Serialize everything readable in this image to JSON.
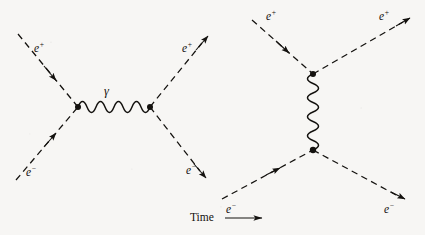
{
  "figure": {
    "background_color": "#f7f6f4",
    "ink_color": "#14120f",
    "axis_label": {
      "text": "Time",
      "arrow": "right-arrow",
      "x": 190,
      "y": 215
    },
    "diagrams": [
      {
        "id": "annihilation",
        "channel": "s-channel",
        "vertices": [
          {
            "name": "left-vertex",
            "x": 78,
            "y": 107
          },
          {
            "name": "right-vertex",
            "x": 150,
            "y": 107
          }
        ],
        "photon": {
          "label": "γ",
          "label_x": 104,
          "label_y": 86,
          "orientation": "horizontal",
          "from": {
            "x": 78,
            "y": 107
          },
          "to": {
            "x": 150,
            "y": 107
          },
          "wavelengths": 4
        },
        "legs": [
          {
            "name": "incoming-positron",
            "label": "e",
            "charge": "+",
            "label_x": 34,
            "label_y": 42,
            "from": {
              "x": 18,
              "y": 34
            },
            "to": {
              "x": 78,
              "y": 107
            },
            "arrow_position": "mid",
            "arrow_direction": "toward-vertex",
            "line_style": "dashed"
          },
          {
            "name": "incoming-electron",
            "label": "e",
            "charge": "−",
            "label_x": 26,
            "label_y": 166,
            "from": {
              "x": 16,
              "y": 180
            },
            "to": {
              "x": 78,
              "y": 107
            },
            "arrow_position": "mid",
            "arrow_direction": "toward-vertex",
            "line_style": "dashed"
          },
          {
            "name": "outgoing-positron",
            "label": "e",
            "charge": "+",
            "label_x": 182,
            "label_y": 42,
            "from": {
              "x": 150,
              "y": 107
            },
            "to": {
              "x": 208,
              "y": 36
            },
            "arrow_position": "end",
            "arrow_direction": "away-from-vertex",
            "line_style": "dashed"
          },
          {
            "name": "outgoing-electron",
            "label": "e",
            "charge": "−",
            "label_x": 186,
            "label_y": 164,
            "from": {
              "x": 150,
              "y": 107
            },
            "to": {
              "x": 206,
              "y": 178
            },
            "arrow_position": "end",
            "arrow_direction": "away-from-vertex",
            "line_style": "dashed"
          }
        ]
      },
      {
        "id": "scattering",
        "channel": "t-channel",
        "vertices": [
          {
            "name": "top-vertex",
            "x": 313,
            "y": 74
          },
          {
            "name": "bottom-vertex",
            "x": 313,
            "y": 150
          }
        ],
        "photon": {
          "label": "",
          "orientation": "vertical",
          "from": {
            "x": 313,
            "y": 74
          },
          "to": {
            "x": 313,
            "y": 150
          },
          "wavelengths": 4
        },
        "legs": [
          {
            "name": "incoming-positron",
            "label": "e",
            "charge": "+",
            "label_x": 266,
            "label_y": 10,
            "from": {
              "x": 252,
              "y": 20
            },
            "to": {
              "x": 313,
              "y": 74
            },
            "arrow_position": "mid",
            "arrow_direction": "toward-vertex",
            "line_style": "dashed"
          },
          {
            "name": "outgoing-positron",
            "label": "e",
            "charge": "+",
            "label_x": 379,
            "label_y": 10,
            "from": {
              "x": 313,
              "y": 74
            },
            "to": {
              "x": 409,
              "y": 18
            },
            "arrow_position": "end",
            "arrow_direction": "away-from-vertex",
            "line_style": "dashed"
          },
          {
            "name": "incoming-electron",
            "label": "e",
            "charge": "−",
            "label_x": 226,
            "label_y": 205,
            "from": {
              "x": 222,
              "y": 199
            },
            "to": {
              "x": 313,
              "y": 150
            },
            "arrow_position": "mid",
            "arrow_direction": "toward-vertex",
            "line_style": "dashed"
          },
          {
            "name": "outgoing-electron",
            "label": "e",
            "charge": "−",
            "label_x": 384,
            "label_y": 205,
            "from": {
              "x": 313,
              "y": 150
            },
            "to": {
              "x": 404,
              "y": 199
            },
            "arrow_position": "end",
            "arrow_direction": "away-from-vertex",
            "line_style": "dashed"
          }
        ]
      }
    ]
  }
}
